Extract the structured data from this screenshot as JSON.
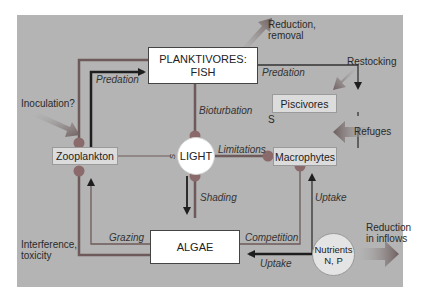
{
  "diagram": {
    "nodes": {
      "planktivores": "PLANKTIVORES:",
      "planktivores_line2": "FISH",
      "piscivores": "Piscivores",
      "zooplankton": "Zooplankton",
      "light": "LIGHT",
      "macrophytes": "Macrophytes",
      "algae": "ALGAE",
      "nutrients": "Nutrients",
      "nutrients_line2": "N, P"
    },
    "edge_labels": {
      "predation_left": "Predation",
      "predation_right": "Predation",
      "bioturbation": "Bioturbation",
      "limitations": "Limitations",
      "shading": "Shading",
      "grazing": "Grazing",
      "competition": "Competition",
      "uptake_right": "Uptake",
      "uptake_bottom": "Uptake",
      "s_piscivores": "S",
      "s_zooplankton": "S"
    },
    "interventions": {
      "reduction_removal": "Reduction,",
      "reduction_removal_line2": "removal",
      "restocking": "Restocking",
      "refuges": "Refuges",
      "inoculation": "Inoculation?",
      "interference": "Interference,",
      "interference_line2": "toxicity",
      "reduction_inflows": "Reduction",
      "reduction_inflows_line2": "in inflows"
    },
    "colors": {
      "panel": "#b4b4b4",
      "line_dark": "#2a2a2a",
      "line_brown": "#6e5a5a",
      "dot": "#8a6a6a",
      "box_white": "#ffffff",
      "box_light": "#dcdcdc",
      "intervention_arrow": "#7a6a6a"
    }
  }
}
